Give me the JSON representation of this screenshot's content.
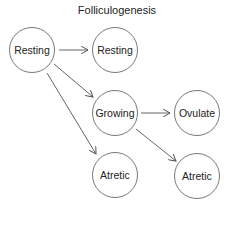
{
  "title": "Folliculogenesis",
  "nodes": [
    {
      "id": "resting-source",
      "label": "Resting",
      "cx": 32,
      "cy": 50
    },
    {
      "id": "resting-target",
      "label": "Resting",
      "cx": 115,
      "cy": 50
    },
    {
      "id": "growing",
      "label": "Growing",
      "cx": 115,
      "cy": 113
    },
    {
      "id": "ovulate",
      "label": "Ovulate",
      "cx": 197,
      "cy": 113
    },
    {
      "id": "atretic-1",
      "label": "Atretic",
      "cx": 115,
      "cy": 175
    },
    {
      "id": "atretic-2",
      "label": "Atretic",
      "cx": 197,
      "cy": 176
    }
  ],
  "edges": [
    {
      "from": "resting-source",
      "to": "resting-target"
    },
    {
      "from": "resting-source",
      "to": "growing"
    },
    {
      "from": "resting-source",
      "to": "atretic-1"
    },
    {
      "from": "growing",
      "to": "ovulate"
    },
    {
      "from": "growing",
      "to": "atretic-2"
    }
  ],
  "colors": {
    "stroke": "#777777",
    "text": "#222222"
  }
}
